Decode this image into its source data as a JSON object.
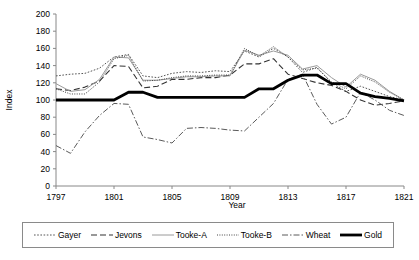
{
  "chart_data": {
    "type": "line",
    "title": "",
    "xlabel": "Year",
    "ylabel": "Index",
    "xlim": [
      1797,
      1821
    ],
    "ylim": [
      0,
      200
    ],
    "ytick_step": 20,
    "xtick_step": 4,
    "grid": false,
    "legend_position": "bottom",
    "x": [
      1797,
      1798,
      1799,
      1800,
      1801,
      1802,
      1803,
      1804,
      1805,
      1806,
      1807,
      1808,
      1809,
      1810,
      1811,
      1812,
      1813,
      1814,
      1815,
      1816,
      1817,
      1818,
      1819,
      1820,
      1821
    ],
    "xtick_labels": [
      "1797",
      "1801",
      "1805",
      "1809",
      "1813",
      "1817",
      "1821"
    ],
    "ytick_labels": [
      "0",
      "20",
      "40",
      "60",
      "80",
      "100",
      "120",
      "140",
      "160",
      "180",
      "200"
    ],
    "series": [
      {
        "name": "Gayer",
        "style": "dotted",
        "color": "#555555",
        "width": 1.0,
        "values": [
          128,
          130,
          131,
          137,
          150,
          153,
          128,
          126,
          131,
          133,
          132,
          134,
          133,
          157,
          150,
          160,
          150,
          132,
          138,
          120,
          110,
          116,
          110,
          104,
          100
        ]
      },
      {
        "name": "Jevons",
        "style": "dashed",
        "color": "#333333",
        "width": 1.1,
        "values": [
          113,
          111,
          115,
          122,
          140,
          139,
          114,
          116,
          124,
          124,
          126,
          126,
          129,
          142,
          142,
          148,
          130,
          125,
          120,
          117,
          110,
          100,
          94,
          96,
          99
        ]
      },
      {
        "name": "Tooke-A",
        "style": "solid",
        "color": "#9a9a9a",
        "width": 1.0,
        "values": [
          119,
          110,
          112,
          124,
          150,
          149,
          123,
          123,
          125,
          127,
          127,
          128,
          128,
          158,
          152,
          157,
          152,
          136,
          140,
          126,
          115,
          130,
          123,
          110,
          100
        ]
      },
      {
        "name": "Tooke-B",
        "style": "fine-dotted",
        "color": "#444444",
        "width": 1.0,
        "values": [
          113,
          107,
          107,
          121,
          148,
          152,
          122,
          123,
          126,
          128,
          128,
          129,
          129,
          160,
          151,
          162,
          150,
          135,
          137,
          121,
          113,
          128,
          121,
          109,
          100
        ]
      },
      {
        "name": "Wheat",
        "style": "dash-dot",
        "color": "#5a5a5a",
        "width": 1.0,
        "values": [
          47,
          38,
          63,
          82,
          96,
          95,
          57,
          54,
          50,
          67,
          68,
          67,
          65,
          64,
          80,
          96,
          124,
          130,
          95,
          72,
          80,
          109,
          100,
          88,
          82
        ]
      },
      {
        "name": "Gold",
        "style": "solid-bold",
        "color": "#000000",
        "width": 2.8,
        "values": [
          100,
          100,
          100,
          100,
          100,
          109,
          109,
          103,
          103,
          103,
          103,
          103,
          103,
          103,
          113,
          113,
          123,
          129,
          129,
          119,
          119,
          108,
          104,
          102,
          99
        ]
      }
    ]
  },
  "legend": {
    "items": [
      {
        "label": "Gayer",
        "swatch": "dotted-line-swatch"
      },
      {
        "label": "Jevons",
        "swatch": "dashed-line-swatch"
      },
      {
        "label": "Tooke-A",
        "swatch": "solid-line-swatch"
      },
      {
        "label": "Tooke-B",
        "swatch": "fine-dotted-line-swatch"
      },
      {
        "label": "Wheat",
        "swatch": "dash-dot-line-swatch"
      },
      {
        "label": "Gold",
        "swatch": "bold-solid-line-swatch"
      }
    ]
  }
}
